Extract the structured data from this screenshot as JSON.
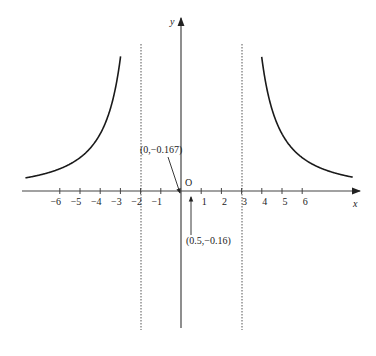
{
  "chart_data": {
    "type": "line",
    "title": "",
    "function": "y = 1/((x+2)(x-3))",
    "xlabel": "x",
    "ylabel": "y",
    "origin_label": "O",
    "x_ticks": [
      -6,
      -5,
      -4,
      -3,
      -2,
      -1,
      1,
      2,
      3,
      4,
      5,
      6
    ],
    "x_tick_labels": [
      "−6",
      "−5",
      "−4",
      "−3",
      "−2",
      "−1",
      "1",
      "2",
      "3",
      "4",
      "5",
      "6"
    ],
    "vertical_asymptotes": [
      -2,
      3
    ],
    "horizontal_asymptote": 0,
    "xlim": [
      -7.7,
      8.5
    ],
    "grid": false,
    "annotations": [
      {
        "text": "(0,−0.167)",
        "point": [
          0,
          -0.167
        ]
      },
      {
        "text": "(0.5,−0.16)",
        "point": [
          0.5,
          -0.16
        ]
      }
    ],
    "series": [
      {
        "name": "left branch",
        "x_range": [
          -7.7,
          -2.05
        ]
      },
      {
        "name": "middle branch",
        "x_range": [
          -1.85,
          2.85
        ]
      },
      {
        "name": "right branch",
        "x_range": [
          3.05,
          8.5
        ]
      }
    ]
  }
}
